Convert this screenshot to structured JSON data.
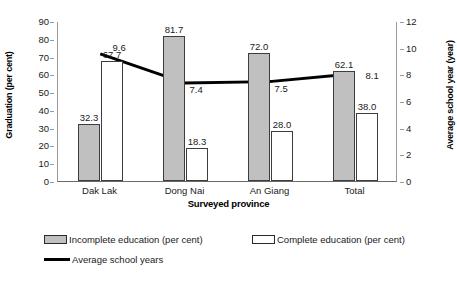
{
  "chart_data": {
    "type": "bar",
    "title": "",
    "subtitle": "",
    "xlabel": "Surveyed province",
    "ylabel": "Graduation (per cent)",
    "y2label": "Average school year (year)",
    "categories": [
      "Dak Lak",
      "Dong Nai",
      "An Giang",
      "Total"
    ],
    "ylim": [
      0,
      90
    ],
    "y2lim": [
      0,
      12
    ],
    "yticks": [
      0,
      10,
      20,
      30,
      40,
      50,
      60,
      70,
      80,
      90
    ],
    "y2ticks": [
      0,
      2,
      4,
      6,
      8,
      10,
      12
    ],
    "ytick_labels": [
      "0",
      "10",
      "20",
      "30",
      "40",
      "50",
      "60",
      "70",
      "80",
      "90"
    ],
    "y2tick_labels": [
      "0",
      "2",
      "4",
      "6",
      "8",
      "10",
      "12"
    ],
    "grid": false,
    "legend_position": "bottom-left",
    "series": [
      {
        "name": "Incomplete education (per cent)",
        "kind": "bar",
        "axis": "left",
        "color": "#C0C0C0",
        "border": "#3D3D3D",
        "values": [
          32.3,
          81.7,
          72.0,
          62.1
        ],
        "labels": [
          "32.3",
          "81.7",
          "72.0",
          "62.1"
        ]
      },
      {
        "name": "Complete education (per cent)",
        "kind": "bar",
        "axis": "left",
        "color": "#FFFFFF",
        "border": "#3D3D3D",
        "values": [
          67.7,
          18.3,
          28.0,
          38.0
        ],
        "labels": [
          "67.7",
          "18.3",
          "28.0",
          "38.0"
        ]
      },
      {
        "name": "Average school years",
        "kind": "line",
        "axis": "right",
        "color": "#000000",
        "values": [
          9.6,
          7.4,
          7.5,
          8.1
        ],
        "labels": [
          "9.6",
          "7.4",
          "7.5",
          "8.1"
        ]
      }
    ]
  },
  "legend": {
    "items": [
      {
        "label": "Incomplete education (per cent)",
        "marker": "gray-square-swatch"
      },
      {
        "label": "Complete education (per cent)",
        "marker": "white-square-swatch"
      },
      {
        "label": "Average school years",
        "marker": "black-line-swatch"
      }
    ]
  }
}
